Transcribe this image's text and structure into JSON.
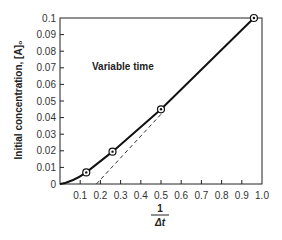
{
  "chart_data": {
    "type": "line",
    "title": "",
    "annotation": "Variable time",
    "xlabel_num": "1",
    "xlabel_den": "Δt",
    "xlabel": "1/Δt",
    "ylabel": "Initial concentration, [A]₀",
    "xlim": [
      0,
      1.0
    ],
    "ylim": [
      0,
      0.1
    ],
    "xticks": [
      "0.1",
      "0.2",
      "0.3",
      "0.4",
      "0.5",
      "0.6",
      "0.7",
      "0.8",
      "0.9",
      "1.0"
    ],
    "yticks": [
      "0",
      "0.01",
      "0.02",
      "0.03",
      "0.04",
      "0.05",
      "0.06",
      "0.07",
      "0.08",
      "0.09",
      "0.1"
    ],
    "grid": false,
    "series": [
      {
        "name": "measured",
        "style": "solid",
        "markers": "circle-dot",
        "x": [
          0.13,
          0.26,
          0.5,
          0.96
        ],
        "y": [
          0.007,
          0.0195,
          0.045,
          0.1
        ]
      },
      {
        "name": "linear extrapolation",
        "style": "dashed",
        "x": [
          0.18,
          0.5
        ],
        "y": [
          0.0,
          0.042
        ]
      }
    ]
  }
}
